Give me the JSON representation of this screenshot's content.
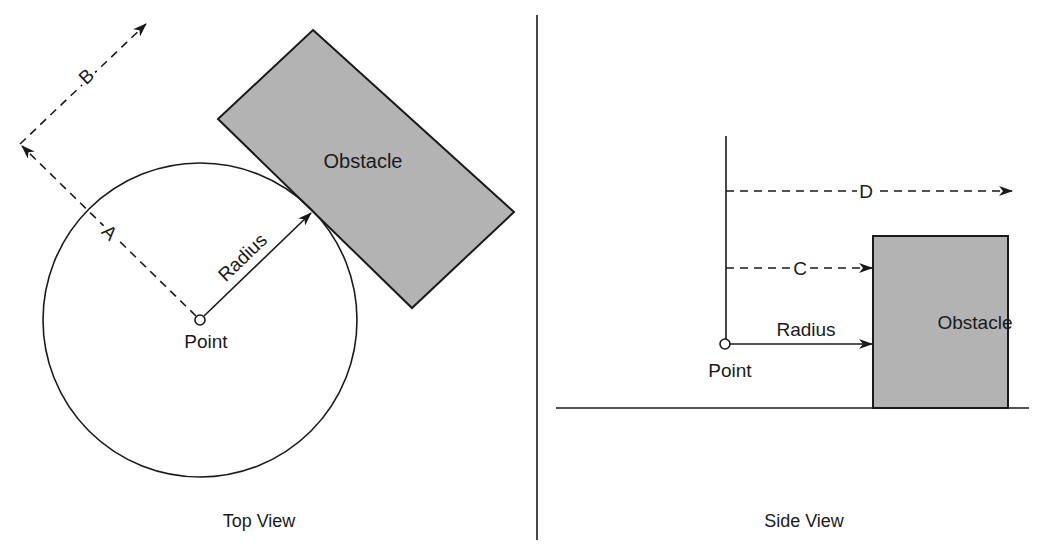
{
  "diagram": {
    "panels": [
      {
        "id": "top",
        "caption": "Top View"
      },
      {
        "id": "side",
        "caption": "Side View"
      }
    ],
    "top_view": {
      "obstacle_label": "Obstacle",
      "radius_label": "Radius",
      "point_label": "Point",
      "ray_a_label": "A",
      "ray_b_label": "B"
    },
    "side_view": {
      "obstacle_label": "Obstacle",
      "radius_label": "Radius",
      "point_label": "Point",
      "ray_c_label": "C",
      "ray_d_label": "D"
    },
    "colors": {
      "line": "#1a1a1a",
      "obstacle_fill": "#b3b3b3",
      "background": "#ffffff"
    }
  }
}
